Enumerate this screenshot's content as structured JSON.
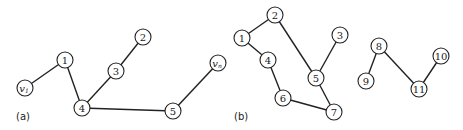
{
  "figure": {
    "panels": [
      {
        "label": "(a)",
        "label_pos": [
          16,
          120
        ],
        "nodes": [
          {
            "id": "v1",
            "text": "v",
            "sub": "1",
            "x": 25,
            "y": 88
          },
          {
            "id": "1",
            "text": "1",
            "x": 65,
            "y": 60
          },
          {
            "id": "2",
            "text": "2",
            "x": 143,
            "y": 37
          },
          {
            "id": "3",
            "text": "3",
            "x": 116,
            "y": 71
          },
          {
            "id": "4",
            "text": "4",
            "x": 82,
            "y": 108
          },
          {
            "id": "5",
            "text": "5",
            "x": 173,
            "y": 111
          },
          {
            "id": "vn",
            "text": "v",
            "sub": "n",
            "x": 218,
            "y": 63
          }
        ],
        "edges": [
          [
            "v1",
            "1"
          ],
          [
            "1",
            "4"
          ],
          [
            "4",
            "3"
          ],
          [
            "3",
            "2"
          ],
          [
            "4",
            "5"
          ],
          [
            "5",
            "vn"
          ]
        ]
      },
      {
        "label": "(b)",
        "label_pos": [
          234,
          120
        ],
        "nodes": [
          {
            "id": "b1",
            "text": "1",
            "x": 242,
            "y": 38
          },
          {
            "id": "b2",
            "text": "2",
            "x": 275,
            "y": 15
          },
          {
            "id": "b3",
            "text": "3",
            "x": 340,
            "y": 35
          },
          {
            "id": "b4",
            "text": "4",
            "x": 268,
            "y": 60
          },
          {
            "id": "b5",
            "text": "5",
            "x": 316,
            "y": 78
          },
          {
            "id": "b6",
            "text": "6",
            "x": 283,
            "y": 98
          },
          {
            "id": "b7",
            "text": "7",
            "x": 334,
            "y": 112
          },
          {
            "id": "b8",
            "text": "8",
            "x": 379,
            "y": 46
          },
          {
            "id": "b9",
            "text": "9",
            "x": 366,
            "y": 81
          },
          {
            "id": "b10",
            "text": "10",
            "x": 441,
            "y": 56
          },
          {
            "id": "b11",
            "text": "11",
            "x": 419,
            "y": 89
          }
        ],
        "edges": [
          [
            "b1",
            "b2"
          ],
          [
            "b2",
            "b5"
          ],
          [
            "b3",
            "b5"
          ],
          [
            "b5",
            "b7"
          ],
          [
            "b1",
            "b4"
          ],
          [
            "b4",
            "b6"
          ],
          [
            "b6",
            "b7"
          ],
          [
            "b8",
            "b9"
          ],
          [
            "b8",
            "b11"
          ],
          [
            "b11",
            "b10"
          ]
        ]
      }
    ]
  }
}
